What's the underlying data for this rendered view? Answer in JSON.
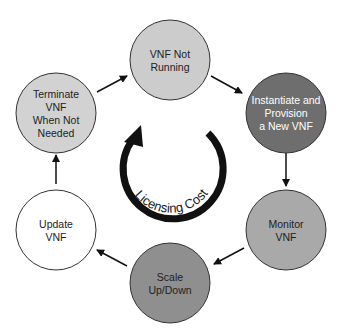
{
  "diagram": {
    "center_label": "Licensing Cost",
    "nodes": [
      {
        "id": "not-running",
        "lines": [
          "VNF Not",
          "Running"
        ],
        "fill": "#cccccc",
        "text_color": "#222222"
      },
      {
        "id": "instantiate",
        "lines": [
          "Instantiate and",
          "Provision",
          "a New VNF"
        ],
        "fill": "#6e6e6e",
        "text_color": "#ffffff"
      },
      {
        "id": "monitor",
        "lines": [
          "Monitor",
          "VNF"
        ],
        "fill": "#a9a9a9",
        "text_color": "#222222"
      },
      {
        "id": "scale",
        "lines": [
          "Scale",
          "Up/Down"
        ],
        "fill": "#8f8f8f",
        "text_color": "#222222"
      },
      {
        "id": "update",
        "lines": [
          "Update",
          "VNF"
        ],
        "fill": "#ffffff",
        "text_color": "#222222"
      },
      {
        "id": "terminate",
        "lines": [
          "Terminate",
          "VNF",
          "When Not",
          "Needed"
        ],
        "fill": "#d2d2d2",
        "text_color": "#222222"
      }
    ],
    "edges": [
      {
        "from": "not-running",
        "to": "instantiate"
      },
      {
        "from": "instantiate",
        "to": "monitor"
      },
      {
        "from": "monitor",
        "to": "scale"
      },
      {
        "from": "scale",
        "to": "update"
      },
      {
        "from": "update",
        "to": "terminate"
      },
      {
        "from": "terminate",
        "to": "not-running"
      }
    ]
  }
}
